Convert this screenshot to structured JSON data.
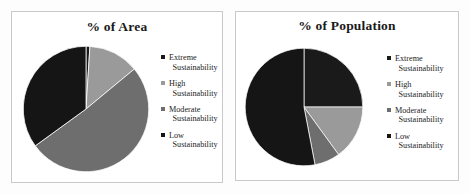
{
  "figure": {
    "background_color": "#ffffff",
    "panel_border_color": "#c9c9c9"
  },
  "palette": {
    "extreme": "#1a1a1a",
    "high": "#9a9a9a",
    "moderate": "#6e6e6e",
    "low": "#151515",
    "text": "#1c1c1c"
  },
  "panels": [
    {
      "id": "area",
      "title": "% of Area",
      "legend": [
        {
          "swatch_name": "legend-swatch-extreme",
          "color": "#1a1a1a",
          "line1": "Extreme",
          "line2": "Sustainability"
        },
        {
          "swatch_name": "legend-swatch-high",
          "color": "#9a9a9a",
          "line1": "High",
          "line2": "Sustainability"
        },
        {
          "swatch_name": "legend-swatch-moderate",
          "color": "#6e6e6e",
          "line1": "Moderate",
          "line2": "Sustainability"
        },
        {
          "swatch_name": "legend-swatch-low",
          "color": "#151515",
          "line1": "Low",
          "line2": "Sustainability"
        }
      ]
    },
    {
      "id": "population",
      "title": "% of Population",
      "legend": [
        {
          "swatch_name": "legend-swatch-extreme",
          "color": "#1a1a1a",
          "line1": "Extreme",
          "line2": "Sustainability"
        },
        {
          "swatch_name": "legend-swatch-high",
          "color": "#9a9a9a",
          "line1": "High",
          "line2": "Sustainability"
        },
        {
          "swatch_name": "legend-swatch-moderate",
          "color": "#6e6e6e",
          "line1": "Moderate",
          "line2": "Sustainability"
        },
        {
          "swatch_name": "legend-swatch-low",
          "color": "#151515",
          "line1": "Low",
          "line2": "Sustainability"
        }
      ]
    }
  ],
  "chart_data": [
    {
      "type": "pie",
      "title": "% of Area",
      "labels": [
        "Extreme Sustainability",
        "High Sustainability",
        "Moderate Sustainability",
        "Low Sustainability"
      ],
      "values": [
        1,
        13,
        51,
        35
      ],
      "unit": "%",
      "colors": [
        "#1a1a1a",
        "#9a9a9a",
        "#6e6e6e",
        "#151515"
      ],
      "start_angle_deg": 0,
      "direction": "clockwise",
      "legend_position": "right",
      "data_labels": false
    },
    {
      "type": "pie",
      "title": "% of Population",
      "labels": [
        "Extreme Sustainability",
        "High Sustainability",
        "Moderate Sustainability",
        "Low Sustainability"
      ],
      "values": [
        25,
        15,
        7,
        53
      ],
      "unit": "%",
      "colors": [
        "#1a1a1a",
        "#9a9a9a",
        "#6e6e6e",
        "#151515"
      ],
      "start_angle_deg": 0,
      "direction": "clockwise",
      "legend_position": "right",
      "data_labels": false
    }
  ]
}
